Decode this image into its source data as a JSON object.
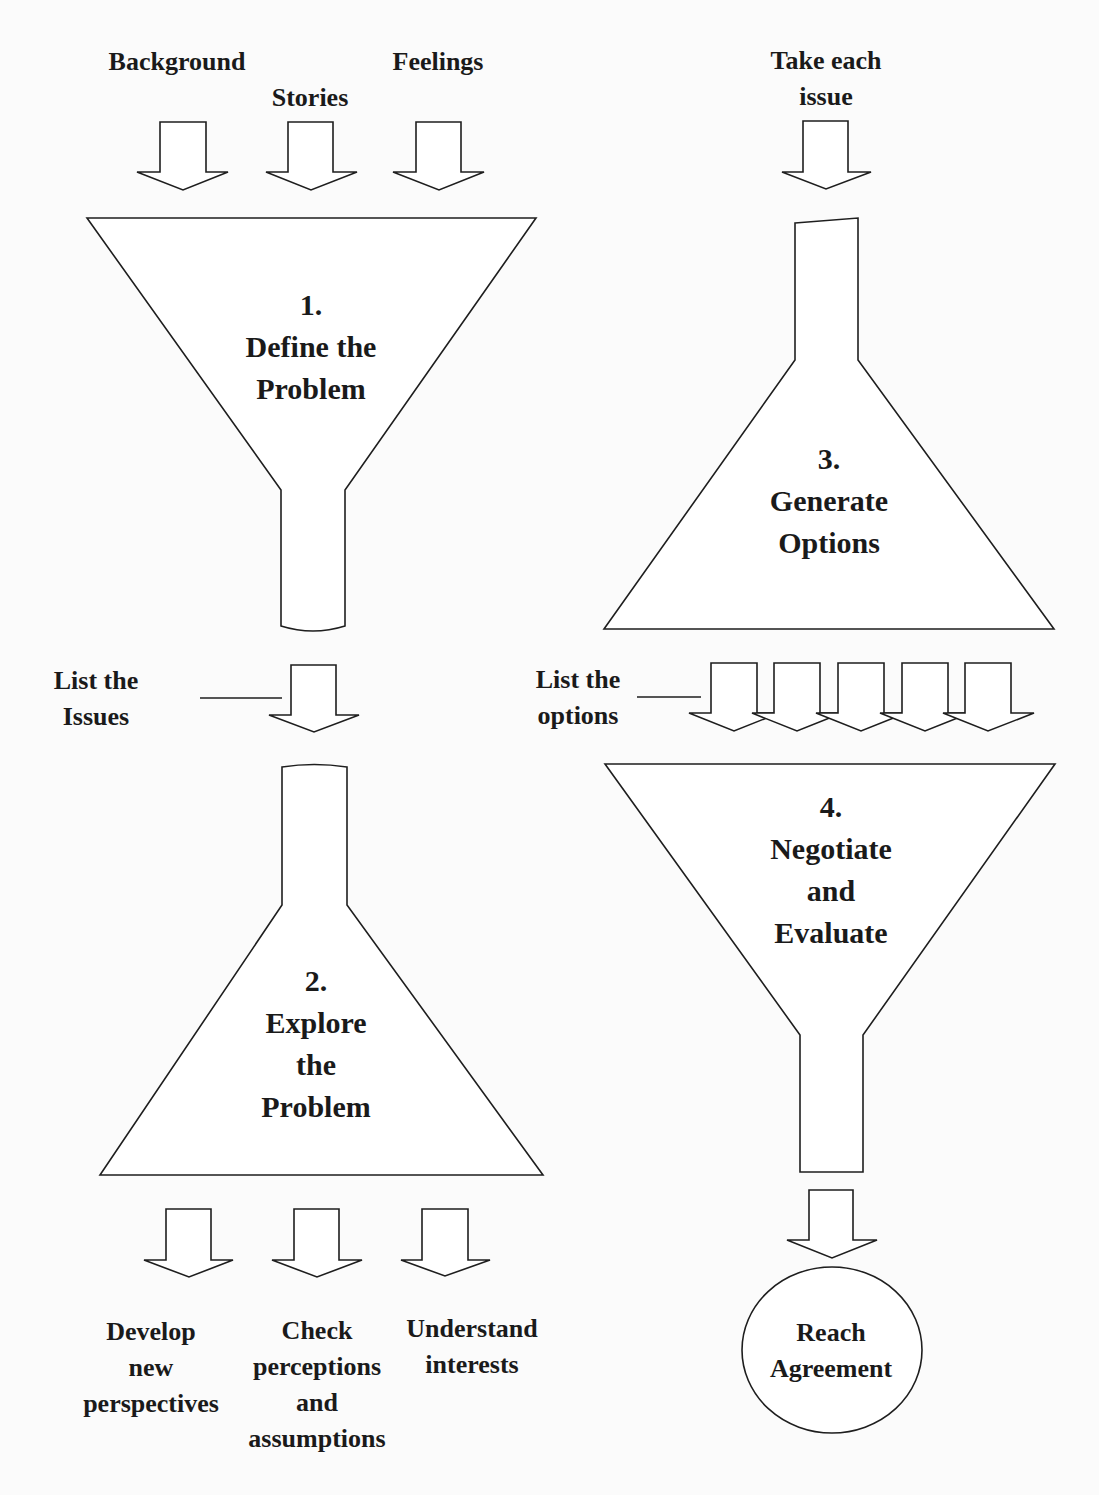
{
  "colors": {
    "stroke": "#1e1e1e",
    "fill": "#ffffff",
    "background": "#fbfbfb",
    "text": "#1a1a1a"
  },
  "inputs": {
    "background": "Background",
    "stories": "Stories",
    "feelings": "Feelings",
    "take_each_issue": [
      "Take each",
      "issue"
    ]
  },
  "stages": [
    {
      "number": "1.",
      "lines": [
        "Define the",
        "Problem"
      ]
    },
    {
      "number": "2.",
      "lines": [
        "Explore",
        "the",
        "Problem"
      ]
    },
    {
      "number": "3.",
      "lines": [
        "Generate",
        "Options"
      ]
    },
    {
      "number": "4.",
      "lines": [
        "Negotiate",
        "and",
        "Evaluate"
      ]
    }
  ],
  "connectors": {
    "list_issues": [
      "List the",
      "Issues"
    ],
    "list_options": [
      "List the",
      "options"
    ]
  },
  "outputs": {
    "develop": [
      "Develop",
      "new",
      "perspectives"
    ],
    "check": [
      "Check",
      "perceptions",
      "and",
      "assumptions"
    ],
    "understand": [
      "Understand",
      "interests"
    ]
  },
  "result": {
    "lines": [
      "Reach",
      "Agreement"
    ]
  }
}
